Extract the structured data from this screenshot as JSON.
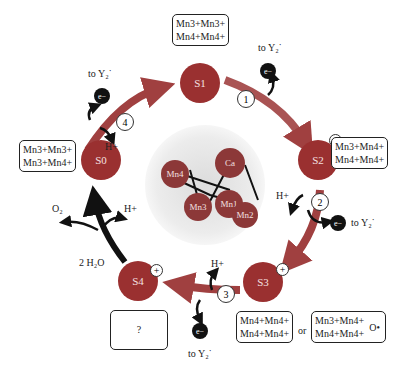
{
  "diagram": {
    "colors": {
      "state_fill": "#9a3030",
      "arrow": "#a04040",
      "black_arrow": "#111111",
      "halo": "#e8e8e8"
    },
    "states": [
      {
        "id": "S0",
        "label": "S0",
        "oxidation": [
          "Mn3+Mn3+",
          "Mn3+Mn4+"
        ],
        "charge": ""
      },
      {
        "id": "S1",
        "label": "S1",
        "oxidation": [
          "Mn3+Mn3+",
          "Mn4+Mn4+"
        ],
        "charge": ""
      },
      {
        "id": "S2",
        "label": "S2",
        "oxidation": [
          "Mn3+Mn4+",
          "Mn4+Mn4+"
        ],
        "charge": "+"
      },
      {
        "id": "S3",
        "label": "S3",
        "oxidation": [
          "Mn4+Mn4+",
          "Mn4+Mn4+"
        ],
        "alt_oxidation": [
          "Mn3+Mn4+",
          "Mn4+Mn4+"
        ],
        "alt_suffix": "O•",
        "charge": "+"
      },
      {
        "id": "S4",
        "label": "S4",
        "oxidation": [
          "?"
        ],
        "charge": "+"
      }
    ],
    "steps": [
      {
        "n": "1",
        "electron": "e−",
        "to": "to Y₂˙",
        "proton": ""
      },
      {
        "n": "2",
        "electron": "e−",
        "to": "to Y₂˙",
        "proton": "H+"
      },
      {
        "n": "3",
        "electron": "e−",
        "to": "to Y₂˙",
        "proton": "H+"
      },
      {
        "n": "4",
        "electron": "e−",
        "to": "to Y₂˙",
        "proton": "H+"
      }
    ],
    "water": {
      "in": "2 H₂O",
      "out_o2": "O₂",
      "out_h": "H+"
    },
    "or_label": "or",
    "cluster": {
      "atoms": [
        "Mn4",
        "Ca",
        "Mn3",
        "Mn1",
        "Mn2"
      ]
    }
  }
}
